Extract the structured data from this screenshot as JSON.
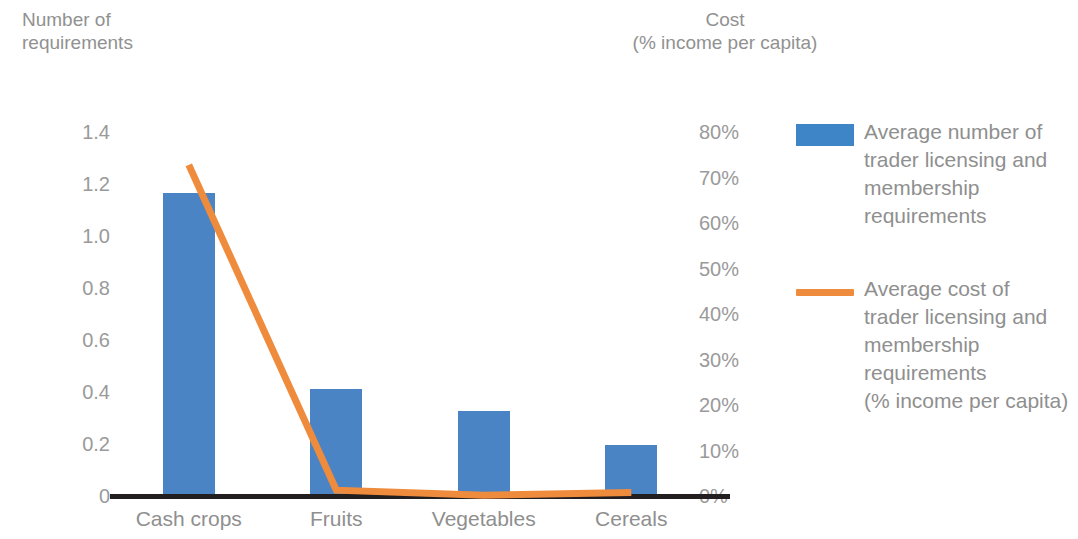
{
  "axes": {
    "left_title": "Number of\nrequirements",
    "right_title": "Cost\n(% income per capita)",
    "left_ticks": [
      "1.4",
      "1.2",
      "1.0",
      "0.8",
      "0.6",
      "0.4",
      "0.2",
      "0"
    ],
    "right_ticks": [
      "80%",
      "70%",
      "60%",
      "50%",
      "40%",
      "30%",
      "20%",
      "10%",
      "0%"
    ]
  },
  "categories": [
    "Cash crops",
    "Fruits",
    "Vegetables",
    "Cereals"
  ],
  "legend": {
    "items": [
      {
        "marker": "bar-swatch",
        "label": "Average number of\ntrader licensing and\nmembership\nrequirements",
        "color": "#3d85c6"
      },
      {
        "marker": "line-swatch",
        "label": "Average cost of\ntrader licensing and\nmembership\nrequirements\n(% income per capita)",
        "color": "#ee8b3d"
      }
    ]
  },
  "colors": {
    "bar": "#4a84c4",
    "line": "#ee8b3d",
    "axis": "#231f20",
    "text": "#8f8f8f"
  },
  "chart_data": {
    "type": "bar",
    "title": "",
    "categories": [
      "Cash crops",
      "Fruits",
      "Vegetables",
      "Cereals"
    ],
    "series": [
      {
        "name": "Average number of trader licensing and membership requirements",
        "type": "bar",
        "axis": "left",
        "color": "#4a84c4",
        "values": [
          1.17,
          0.415,
          0.33,
          0.2
        ]
      },
      {
        "name": "Average cost of trader licensing and membership requirements (% income per capita)",
        "type": "line",
        "axis": "right",
        "color": "#ee8b3d",
        "values": [
          73,
          1.5,
          0.4,
          1.0
        ]
      }
    ],
    "xlabel": "",
    "ylabel": "Number of requirements",
    "y2label": "Cost (% income per capita)",
    "ylim": [
      0,
      1.4
    ],
    "y2lim": [
      0,
      80
    ],
    "yticks": [
      0,
      0.2,
      0.4,
      0.6,
      0.8,
      1.0,
      1.2,
      1.4
    ],
    "y2ticks": [
      0,
      10,
      20,
      30,
      40,
      50,
      60,
      70,
      80
    ],
    "grid": false,
    "legend_position": "right"
  }
}
